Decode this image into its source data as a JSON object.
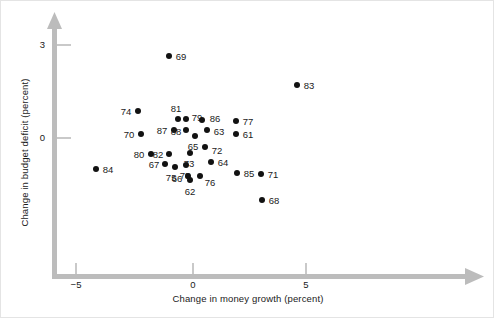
{
  "chart_data": {
    "type": "scatter",
    "title": "",
    "xlabel": "Change in money growth (percent)",
    "ylabel": "Change in budget deficit (percent)",
    "xlim": [
      -6.5,
      12.0
    ],
    "ylim": [
      -4.3,
      3.9
    ],
    "xticks": [
      -5,
      0,
      5
    ],
    "xtick_labels": [
      "−5",
      "0",
      "5"
    ],
    "yticks": [
      0,
      3
    ],
    "ytick_labels": [
      "0",
      "3"
    ],
    "grid": false,
    "legend": null,
    "point_label_field": "label",
    "points": [
      {
        "label": "69",
        "x": -1.06,
        "y": 2.65
      },
      {
        "label": "83",
        "x": 4.6,
        "y": 1.71
      },
      {
        "label": "74",
        "x": -2.43,
        "y": 0.87
      },
      {
        "label": "81",
        "x": -0.66,
        "y": 0.61
      },
      {
        "label": "79",
        "x": -0.31,
        "y": 0.61
      },
      {
        "label": "86",
        "x": 0.4,
        "y": 0.58
      },
      {
        "label": "77",
        "x": 1.9,
        "y": 0.55
      },
      {
        "label": "87",
        "x": -0.84,
        "y": 0.26
      },
      {
        "label": "88",
        "x": -0.31,
        "y": 0.26
      },
      {
        "label": "63",
        "x": 0.62,
        "y": 0.26
      },
      {
        "label": "70",
        "x": -2.3,
        "y": 0.13
      },
      {
        "label": "61",
        "x": 1.9,
        "y": 0.13
      },
      {
        "label": "65",
        "x": 0.09,
        "y": 0.06
      },
      {
        "label": "72",
        "x": 0.53,
        "y": -0.29
      },
      {
        "label": "80",
        "x": -1.86,
        "y": -0.52
      },
      {
        "label": "82",
        "x": -1.06,
        "y": -0.52
      },
      {
        "label": "73",
        "x": -0.13,
        "y": -0.48
      },
      {
        "label": "64",
        "x": 0.8,
        "y": -0.77
      },
      {
        "label": "67",
        "x": -1.24,
        "y": -0.84
      },
      {
        "label": "78",
        "x": -0.31,
        "y": -0.87
      },
      {
        "label": "75",
        "x": -0.79,
        "y": -0.94
      },
      {
        "label": "85",
        "x": 1.95,
        "y": -1.13
      },
      {
        "label": "71",
        "x": 3.01,
        "y": -1.16
      },
      {
        "label": "66",
        "x": -0.22,
        "y": -1.23
      },
      {
        "label": "76",
        "x": 0.31,
        "y": -1.23
      },
      {
        "label": "62",
        "x": -0.13,
        "y": -1.35
      },
      {
        "label": "84",
        "x": -4.29,
        "y": -1.0
      },
      {
        "label": "68",
        "x": 3.05,
        "y": -2.0
      }
    ]
  },
  "axes": {
    "x_title": "Change in money growth (percent)",
    "y_title": "Change in budget deficit (percent)",
    "x_tick_labels": [
      "−5",
      "0",
      "5"
    ],
    "y_tick_labels": [
      "3",
      "0"
    ],
    "axis_color": "#b6b6b6"
  },
  "colors": {
    "point": "#121212",
    "text": "#1a1a1a",
    "axis": "#b6b6b6",
    "background": "#ffffff",
    "frame": "#e4e4e4"
  }
}
